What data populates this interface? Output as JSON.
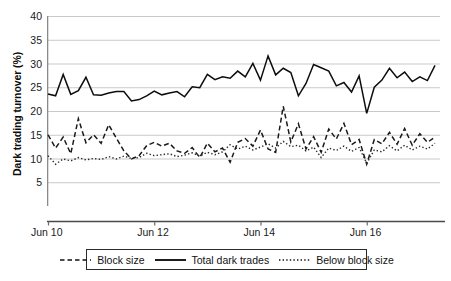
{
  "chart_data": {
    "type": "line",
    "title": "",
    "xlabel": "",
    "ylabel": "Dark trading turnover (%)",
    "ylim": [
      0,
      40
    ],
    "yticks": [
      40,
      35,
      30,
      25,
      20,
      15,
      10,
      5
    ],
    "ytick_labels": [
      "40",
      "35",
      "30",
      "25",
      "20",
      "15",
      "10",
      "5"
    ],
    "grid": true,
    "grid_axis": "y",
    "legend_position": "bottom-center",
    "x_axis_type": "date",
    "xticks": [
      0,
      14,
      28,
      42
    ],
    "xtick_labels": [
      "Jun 10",
      "Jun 12",
      "Jun 14",
      "Jun 16"
    ],
    "n_points": 52,
    "series": [
      {
        "name": "Block size",
        "style": "dashed",
        "color": "#1a1a1a",
        "values": [
          15.0,
          12.2,
          14.5,
          11.0,
          18.4,
          13.3,
          15.0,
          13.2,
          17.1,
          14.3,
          11.6,
          9.9,
          10.6,
          12.7,
          13.4,
          12.6,
          13.2,
          11.6,
          11.1,
          12.3,
          10.2,
          13.2,
          11.4,
          12.2,
          9.2,
          13.4,
          14.2,
          12.6,
          16.0,
          12.0,
          11.3,
          21.0,
          13.5,
          17.3,
          12.0,
          14.6,
          11.3,
          16.2,
          14.1,
          17.4,
          12.9,
          14.0,
          8.8,
          14.0,
          13.1,
          15.5,
          13.0,
          16.3,
          12.8,
          15.2,
          13.4,
          14.5
        ]
      },
      {
        "name": "Total dark trades",
        "style": "solid",
        "color": "#0d0d0d",
        "values": [
          23.6,
          23.2,
          27.7,
          23.5,
          24.3,
          27.1,
          23.4,
          23.3,
          23.8,
          24.1,
          24.1,
          22.1,
          22.4,
          23.2,
          24.2,
          23.4,
          23.8,
          24.1,
          23.0,
          25.1,
          24.9,
          27.7,
          26.6,
          27.2,
          26.9,
          28.4,
          27.2,
          30.0,
          26.5,
          31.6,
          27.6,
          29.0,
          28.1,
          23.2,
          25.8,
          29.8,
          29.1,
          28.4,
          25.3,
          26.0,
          24.0,
          27.4,
          19.5,
          25.0,
          26.5,
          29.0,
          27.0,
          28.2,
          26.2,
          27.2,
          26.4,
          29.6
        ]
      },
      {
        "name": "Below block size",
        "style": "dotted",
        "color": "#2a2a2a",
        "values": [
          10.6,
          8.8,
          9.9,
          9.5,
          10.2,
          9.7,
          10.0,
          9.8,
          10.4,
          9.9,
          10.5,
          10.0,
          10.2,
          11.1,
          10.6,
          10.8,
          11.0,
          10.4,
          10.7,
          11.2,
          10.5,
          11.3,
          10.8,
          11.4,
          12.9,
          12.0,
          12.6,
          11.8,
          12.4,
          13.1,
          12.2,
          13.6,
          12.5,
          12.8,
          11.6,
          12.4,
          10.2,
          12.2,
          11.7,
          12.6,
          11.5,
          12.3,
          9.0,
          11.8,
          11.4,
          12.7,
          11.6,
          12.8,
          11.8,
          12.6,
          12.0,
          13.2
        ]
      }
    ]
  },
  "legend": {
    "items": [
      {
        "label": "Block size",
        "style": "dashed"
      },
      {
        "label": "Total dark trades",
        "style": "solid"
      },
      {
        "label": "Below block size",
        "style": "dotted"
      }
    ]
  }
}
